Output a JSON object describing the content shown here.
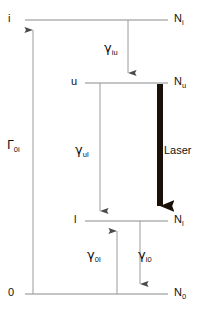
{
  "figure": {
    "type": "energy-level-diagram",
    "colors": {
      "level_line": "#8a8a8a",
      "thin_arrow": "#9a9a9a",
      "laser_arrow": "#1a1008",
      "text": "#111111",
      "background": "#ffffff"
    }
  },
  "levels": [
    {
      "id": "i",
      "left_label": "i",
      "right_label": "N",
      "right_sub": "i",
      "y": 20
    },
    {
      "id": "u",
      "left_label": "u",
      "right_label": "N",
      "right_sub": "u",
      "y": 83
    },
    {
      "id": "l",
      "left_label": "l",
      "right_label": "N",
      "right_sub": "l",
      "y": 221
    },
    {
      "id": "0",
      "left_label": "0",
      "right_label": "N",
      "right_sub": "0",
      "y": 294
    }
  ],
  "transitions": [
    {
      "id": "gamma_iu",
      "symbol": "γ",
      "sub": "iu",
      "from": "i",
      "to": "u",
      "direction": "down",
      "style": "thin",
      "label_x": 104,
      "label_y": 41
    },
    {
      "id": "gamma_ul",
      "symbol": "γ",
      "sub": "ul",
      "from": "u",
      "to": "l",
      "direction": "down",
      "style": "thin",
      "label_x": 75,
      "label_y": 143
    },
    {
      "id": "gamma_0l",
      "symbol": "γ",
      "sub": "0l",
      "from": "0",
      "to": "l",
      "direction": "up",
      "style": "thin",
      "label_x": 87,
      "label_y": 248
    },
    {
      "id": "gamma_l0",
      "symbol": "γ",
      "sub": "l0",
      "from": "l",
      "to": "0",
      "direction": "down",
      "style": "thin",
      "label_x": 138,
      "label_y": 248
    },
    {
      "id": "Gamma_0i",
      "symbol": "Γ",
      "sub": "0i",
      "from": "0",
      "to": "i",
      "direction": "up",
      "style": "thin",
      "label_x": 7,
      "label_y": 138
    },
    {
      "id": "laser",
      "symbol": "Laser",
      "sub": "",
      "from": "u",
      "to": "l",
      "direction": "down",
      "style": "thick",
      "label_x": 164,
      "label_y": 145
    }
  ],
  "labels": {
    "level_i": "i",
    "level_u": "u",
    "level_l": "l",
    "level_0": "0",
    "pop_i": "N",
    "pop_i_sub": "i",
    "pop_u": "N",
    "pop_u_sub": "u",
    "pop_l": "N",
    "pop_l_sub": "l",
    "pop_0": "N",
    "pop_0_sub": "0",
    "gamma_iu": "γ",
    "gamma_iu_sub": "iu",
    "gamma_ul": "γ",
    "gamma_ul_sub": "ul",
    "gamma_0l": "γ",
    "gamma_0l_sub": "0l",
    "gamma_l0": "γ",
    "gamma_l0_sub": "l0",
    "Gamma_0i": "Γ",
    "Gamma_0i_sub": "0i",
    "laser": "Laser"
  }
}
